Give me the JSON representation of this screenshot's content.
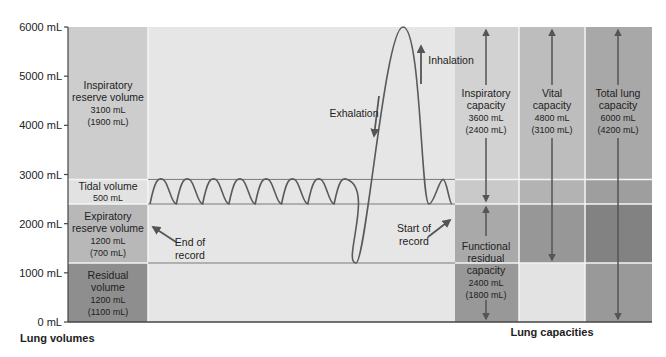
{
  "chart_data": {
    "type": "diagram",
    "y_axis": {
      "unit": "mL",
      "range": [
        0,
        6000
      ],
      "ticks": [
        {
          "value": 0,
          "label": "0 mL"
        },
        {
          "value": 1000,
          "label": "1000 mL"
        },
        {
          "value": 2000,
          "label": "2000 mL"
        },
        {
          "value": 3000,
          "label": "3000 mL"
        },
        {
          "value": 4000,
          "label": "4000 mL"
        },
        {
          "value": 5000,
          "label": "5000 mL"
        },
        {
          "value": 6000,
          "label": "6000 mL"
        }
      ]
    },
    "boundaries_ml": [
      0,
      1200,
      2400,
      2900,
      6000
    ],
    "lung_volumes": {
      "label": "Lung volumes",
      "items": [
        {
          "name": "Inspiratory reserve volume",
          "lines": [
            "Inspiratory",
            "reserve volume",
            "3100 mL",
            "(1900 mL)"
          ],
          "from": 2900,
          "to": 6000,
          "male_ml": 3100,
          "female_ml": 1900,
          "color": "#cdcdcd"
        },
        {
          "name": "Tidal volume",
          "lines": [
            "Tidal volume",
            "500 mL"
          ],
          "from": 2400,
          "to": 2900,
          "male_ml": 500,
          "color": "#e2e2e2"
        },
        {
          "name": "Expiratory reserve volume",
          "lines": [
            "Expiratory",
            "reserve volume",
            "1200 mL",
            "(700 mL)"
          ],
          "from": 1200,
          "to": 2400,
          "male_ml": 1200,
          "female_ml": 700,
          "color": "#b8b8b8"
        },
        {
          "name": "Residual volume",
          "lines": [
            "Residual",
            "volume",
            "1200 mL",
            "(1100 mL)"
          ],
          "from": 0,
          "to": 1200,
          "male_ml": 1200,
          "female_ml": 1100,
          "color": "#8e8e8e"
        }
      ]
    },
    "lung_capacities": {
      "label": "Lung capacities",
      "items": [
        {
          "name": "Inspiratory capacity",
          "lines": [
            "Inspiratory",
            "capacity",
            "3600 mL",
            "(2400 mL)"
          ],
          "from": 2400,
          "to": 6000,
          "male_ml": 3600,
          "female_ml": 2400
        },
        {
          "name": "Functional residual capacity",
          "lines": [
            "Functional",
            "residual",
            "capacity",
            "2400 mL",
            "(1800 mL)"
          ],
          "from": 0,
          "to": 2400,
          "male_ml": 2400,
          "female_ml": 1800
        },
        {
          "name": "Vital capacity",
          "lines": [
            "Vital",
            "capacity",
            "4800 mL",
            "(3100 mL)"
          ],
          "from": 1200,
          "to": 6000,
          "male_ml": 4800,
          "female_ml": 3100
        },
        {
          "name": "Total lung capacity",
          "lines": [
            "Total lung",
            "capacity",
            "6000 mL",
            "(4200 mL)"
          ],
          "from": 0,
          "to": 6000,
          "male_ml": 6000,
          "female_ml": 4200
        }
      ]
    },
    "capacity_column_colors": [
      {
        "top": "#d2d2d2",
        "tidal": "#c9c9c9",
        "erv": "#a9a9a9",
        "rv": "#989898"
      },
      {
        "top": "#bdbdbd",
        "tidal": "#b3b3b3",
        "erv": "#979797",
        "rv": "#e3e3e3"
      },
      {
        "top": "#a8a8a8",
        "tidal": "#9e9e9e",
        "erv": "#828282",
        "rv": "#999999"
      }
    ],
    "trace": {
      "baseline_ml": 2400,
      "tidal_peak_ml": 2900,
      "max_inspiration_ml": 6000,
      "max_expiration_ml": 1200,
      "quiet_breaths_after_max": 1,
      "quiet_breaths_before_max": 8
    },
    "annotations": [
      {
        "text_lines": [
          "End of",
          "record"
        ],
        "points_to": "left end of trace"
      },
      {
        "text_lines": [
          "Start of",
          "record"
        ],
        "points_to": "right end of trace"
      },
      {
        "text_lines": [
          "Exhalation"
        ],
        "arrow": "down"
      },
      {
        "text_lines": [
          "Inhalation"
        ],
        "arrow": "up"
      }
    ],
    "colors": {
      "graph_background": "#e6e6e6",
      "gridline": "#f4f4f4",
      "trace": "#5a5a5a",
      "level_line": "#7a7a7a",
      "arrow": "#555555",
      "text": "#222222"
    }
  }
}
